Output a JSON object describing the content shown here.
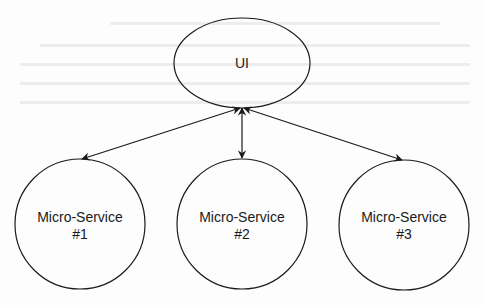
{
  "diagram": {
    "type": "architecture",
    "stroke_color": "#1a1a1a",
    "background_color": "#fdfdfd",
    "nodes": [
      {
        "id": "ui",
        "shape": "ellipse",
        "label_lines": [
          "UI"
        ],
        "cx": 242,
        "cy": 63,
        "rx": 68,
        "ry": 45
      },
      {
        "id": "ms1",
        "shape": "circle",
        "label_lines": [
          "Micro-Service",
          "#1"
        ],
        "cx": 80,
        "cy": 224,
        "r": 65
      },
      {
        "id": "ms2",
        "shape": "circle",
        "label_lines": [
          "Micro-Service",
          "#2"
        ],
        "cx": 242,
        "cy": 224,
        "r": 65
      },
      {
        "id": "ms3",
        "shape": "circle",
        "label_lines": [
          "Micro-Service",
          "#3"
        ],
        "cx": 404,
        "cy": 225,
        "r": 65
      }
    ],
    "edges": [
      {
        "from": "ui",
        "to": "ms1",
        "direction": "both"
      },
      {
        "from": "ui",
        "to": "ms2",
        "direction": "both"
      },
      {
        "from": "ui",
        "to": "ms3",
        "direction": "both"
      }
    ]
  },
  "labels": {
    "ui": "UI",
    "ms1_line1": "Micro-Service",
    "ms1_line2": "#1",
    "ms2_line1": "Micro-Service",
    "ms2_line2": "#2",
    "ms3_line1": "Micro-Service",
    "ms3_line2": "#3"
  }
}
